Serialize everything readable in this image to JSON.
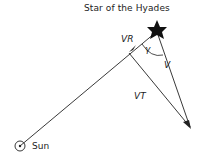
{
  "diagram": {
    "title": "Star of the Hyades",
    "labels": {
      "radial_velocity": "VR",
      "angle": "γ",
      "velocity": "V",
      "tangential_velocity": "VT",
      "sun": "Sun"
    },
    "colors": {
      "line": "#222222",
      "background": "#ffffff"
    }
  }
}
